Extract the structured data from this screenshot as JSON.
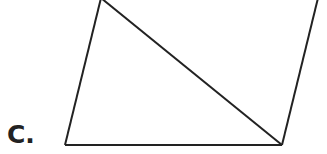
{
  "option_label": "C.",
  "figure": {
    "stroke_color": "#222222",
    "stroke_width": 2,
    "vertices": {
      "top_left": [
        101,
        -2
      ],
      "bottom_left": [
        65,
        145
      ],
      "bottom_right": [
        282,
        145
      ],
      "top_right": [
        318,
        -2
      ]
    }
  }
}
